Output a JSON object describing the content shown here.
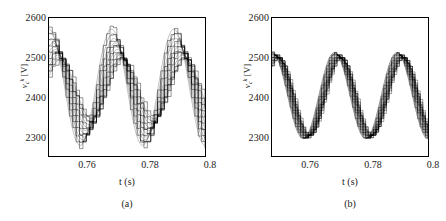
{
  "figure": {
    "background_color": "#ffffff",
    "line_color": "#000000",
    "axis_color": "#000000"
  },
  "chart_data": [
    {
      "type": "line",
      "panel_id": "a",
      "subcaption": "(a)",
      "title": "",
      "xlabel": "t (s)",
      "ylabel": "v_c^k [V]",
      "ylabel_parts": {
        "variable": "v",
        "subscript": "c",
        "superscript": "k",
        "unit": "[V]"
      },
      "xlim": [
        0.75,
        0.8
      ],
      "ylim": [
        2250,
        2600
      ],
      "xticks": [
        0.76,
        0.78,
        0.8
      ],
      "xtick_labels": [
        "0.76",
        "0.78",
        "0.8"
      ],
      "yticks": [
        2300,
        2400,
        2500,
        2600
      ],
      "ytick_labels": [
        "2300",
        "2400",
        "2500",
        "2600"
      ],
      "grid": false,
      "legend": "none",
      "waveform_style": "stepped staircase, multiple submodule capacitor voltages, widely dispersed",
      "series_count": 10,
      "description": "Ten submodule capacitor voltages with large ripple spread; peaks range approximately 2495-2572 V and troughs approximately 2275-2345 V",
      "envelope": {
        "peak_min": 2495,
        "peak_max": 2572,
        "trough_min": 2275,
        "trough_max": 2345,
        "mean_level": 2420
      },
      "series": [
        {
          "name": "v_c^1",
          "peak": 2572,
          "trough": 2277,
          "phase_offset": 0.0
        },
        {
          "name": "v_c^2",
          "peak": 2560,
          "trough": 2284,
          "phase_offset": 0.0004
        },
        {
          "name": "v_c^3",
          "peak": 2548,
          "trough": 2291,
          "phase_offset": 0.0008
        },
        {
          "name": "v_c^4",
          "peak": 2537,
          "trough": 2298,
          "phase_offset": 0.0012
        },
        {
          "name": "v_c^5",
          "peak": 2527,
          "trough": 2306,
          "phase_offset": 0.0016
        },
        {
          "name": "v_c^6",
          "peak": 2520,
          "trough": 2314,
          "phase_offset": 0.002
        },
        {
          "name": "v_c^7",
          "peak": 2513,
          "trough": 2322,
          "phase_offset": 0.0024
        },
        {
          "name": "v_c^8",
          "peak": 2506,
          "trough": 2330,
          "phase_offset": 0.0028
        },
        {
          "name": "v_c^9",
          "peak": 2500,
          "trough": 2338,
          "phase_offset": 0.0032
        },
        {
          "name": "v_c^10",
          "peak": 2495,
          "trough": 2345,
          "phase_offset": 0.0036
        }
      ]
    },
    {
      "type": "line",
      "panel_id": "b",
      "subcaption": "(b)",
      "title": "",
      "xlabel": "t (s)",
      "ylabel": "v_c^k [V]",
      "ylabel_parts": {
        "variable": "v",
        "subscript": "c",
        "superscript": "k",
        "unit": "[V]"
      },
      "xlim": [
        0.75,
        0.8
      ],
      "ylim": [
        2250,
        2600
      ],
      "xticks": [
        0.76,
        0.78,
        0.8
      ],
      "xtick_labels": [
        "0.76",
        "0.78",
        "0.8"
      ],
      "yticks": [
        2300,
        2400,
        2500,
        2600
      ],
      "ytick_labels": [
        "2300",
        "2400",
        "2500",
        "2600"
      ],
      "grid": false,
      "legend": "none",
      "waveform_style": "stepped staircase, multiple submodule capacitor voltages, tightly converged",
      "series_count": 10,
      "description": "Ten submodule capacitor voltages tightly balanced and nearly overlapping; peaks approximately 2498-2512 V and troughs approximately 2294-2303 V",
      "envelope": {
        "peak_min": 2498,
        "peak_max": 2512,
        "trough_min": 2294,
        "trough_max": 2303,
        "mean_level": 2400
      },
      "series": [
        {
          "name": "v_c^1",
          "peak": 2512,
          "trough": 2294,
          "phase_offset": 0.0
        },
        {
          "name": "v_c^2",
          "peak": 2510,
          "trough": 2295,
          "phase_offset": 0.0003
        },
        {
          "name": "v_c^3",
          "peak": 2508,
          "trough": 2296,
          "phase_offset": 0.0006
        },
        {
          "name": "v_c^4",
          "peak": 2506,
          "trough": 2297,
          "phase_offset": 0.0009
        },
        {
          "name": "v_c^5",
          "peak": 2505,
          "trough": 2298,
          "phase_offset": 0.0012
        },
        {
          "name": "v_c^6",
          "peak": 2504,
          "trough": 2299,
          "phase_offset": 0.0014
        },
        {
          "name": "v_c^7",
          "peak": 2502,
          "trough": 2300,
          "phase_offset": 0.0016
        },
        {
          "name": "v_c^8",
          "peak": 2501,
          "trough": 2301,
          "phase_offset": 0.0018
        },
        {
          "name": "v_c^9",
          "peak": 2500,
          "trough": 2302,
          "phase_offset": 0.002
        },
        {
          "name": "v_c^10",
          "peak": 2498,
          "trough": 2303,
          "phase_offset": 0.0022
        }
      ]
    }
  ]
}
